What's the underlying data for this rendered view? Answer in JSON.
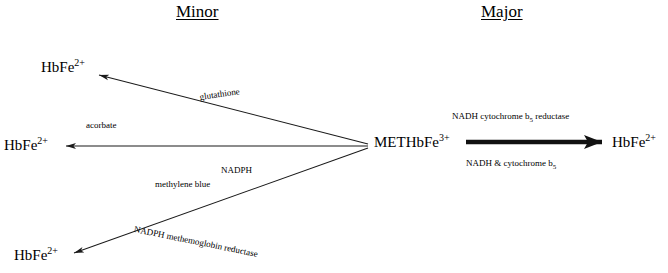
{
  "headings": {
    "minor": "Minor",
    "major": "Major"
  },
  "species": {
    "hbfe_top": "HbFe",
    "hbfe_top_charge": "2+",
    "hbfe_middle": "HbFe",
    "hbfe_middle_charge": "2+",
    "hbfe_bottom": "HbFe",
    "hbfe_bottom_charge": "2+",
    "methbfe": "METHbFe",
    "methbfe_charge": "3+",
    "hbfe_right": "HbFe",
    "hbfe_right_charge": "2+"
  },
  "annotations": {
    "glutathione": "glutathione",
    "acorbate": "acorbate",
    "nadph": "NADPH",
    "methylene_blue": "methylene blue",
    "nadph_methemoglobin_reductase": "NADPH methemoglobin reductase",
    "nadh_cytochrome_reductase_pre": "NADH cytochrome b",
    "nadh_cytochrome_reductase_sub": "5",
    "nadh_cytochrome_reductase_post": " reductase",
    "nadh_cytochrome_pre": "NADH &   cytochrome b",
    "nadh_cytochrome_sub": "5"
  },
  "colors": {
    "background": "#ffffff",
    "ink": "#000000",
    "line": "#1a1a1a"
  }
}
